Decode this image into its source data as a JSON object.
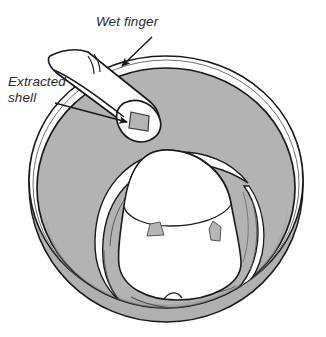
{
  "figure": {
    "background_color": "#ffffff",
    "line_color": "#1a1a1a",
    "water_fill_color": "#b3b3b3",
    "shell_fragment_color": "#b5b5b5",
    "egg_fill_color": "#ffffff",
    "rim_fill_color": "#ffffff",
    "text_color": "#2b2b2b"
  },
  "callouts": [
    {
      "id": "wet-finger",
      "label": "Wet finger",
      "lines": [
        "Wet finger"
      ],
      "arrow": "down-left",
      "points_to": "finger"
    },
    {
      "id": "extracted-shell",
      "label": "Extracted shell",
      "lines": [
        "Extracted",
        "shell"
      ],
      "arrow": "right",
      "points_to": "shell-fragment-on-fingertip"
    }
  ],
  "objects": {
    "bowl": "bowl-of-water",
    "egg": "peeled-boiled-egg",
    "finger": "index-finger",
    "shell_fragments_count": 3
  }
}
